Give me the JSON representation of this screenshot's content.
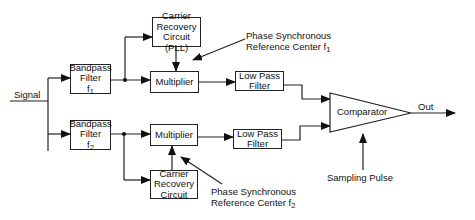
{
  "diagram": {
    "type": "block-diagram",
    "input_label": "Signal",
    "output_label": "Out",
    "upper_branch": {
      "bandpass": {
        "line1": "Bandpass",
        "line2": "Filter",
        "freq": "f",
        "freq_sub": "1"
      },
      "carrier_recovery": {
        "line1": "Carrier",
        "line2": "Recovery",
        "line3": "Circuit (PLL)"
      },
      "multiplier": "Multiplier",
      "lowpass": {
        "line1": "Low Pass",
        "line2": "Filter"
      },
      "reference_note": {
        "line1": "Phase Synchronous",
        "line2": "Reference Center f",
        "sub": "1"
      }
    },
    "lower_branch": {
      "bandpass": {
        "line1": "Bandpass",
        "line2": "Filter",
        "freq": "f",
        "freq_sub": "2"
      },
      "carrier_recovery": {
        "line1": "Carrier",
        "line2": "Recovery",
        "line3": "Circuit"
      },
      "multiplier": "Multiplier",
      "lowpass": {
        "line1": "Low Pass",
        "line2": "Filter"
      },
      "reference_note": {
        "line1": "Phase Synchronous",
        "line2": "Reference Center f",
        "sub": "2"
      }
    },
    "comparator": "Comparator",
    "sampling_label": "Sampling Pulse",
    "colors": {
      "line": "#222222",
      "background": "#ffffff"
    }
  }
}
